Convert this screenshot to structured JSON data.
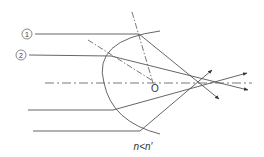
{
  "diagram": {
    "ray_labels": [
      "①",
      "②"
    ],
    "center_label": "O",
    "condition_label": "n<n′",
    "colors": {
      "line": "#555555",
      "text": "#333333",
      "background": "#ffffff"
    }
  }
}
